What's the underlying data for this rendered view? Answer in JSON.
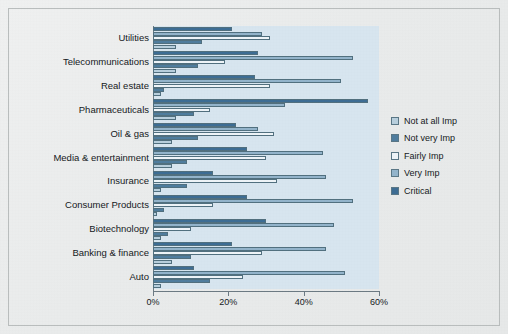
{
  "chart_data": {
    "type": "bar",
    "orientation": "horizontal",
    "title": "",
    "xlabel": "",
    "ylabel": "",
    "xlim": [
      0,
      60
    ],
    "xticks": [
      "0%",
      "20%",
      "40%",
      "60%"
    ],
    "xtick_values": [
      0,
      20,
      40,
      60
    ],
    "grid": false,
    "legend_position": "right",
    "categories": [
      "Utilities",
      "Telecommunications",
      "Real estate",
      "Pharmaceuticals",
      "Oil & gas",
      "Media & entertainment",
      "Insurance",
      "Consumer Products",
      "Biotechnology",
      "Banking & finance",
      "Auto"
    ],
    "series": [
      {
        "name": "Not at all Imp",
        "color": "#b8cfdd",
        "values": [
          6,
          6,
          2,
          6,
          5,
          5,
          2,
          1,
          2,
          5,
          2
        ]
      },
      {
        "name": "Not very Imp",
        "color": "#4f7d9e",
        "values": [
          13,
          12,
          3,
          11,
          12,
          9,
          9,
          3,
          4,
          10,
          15
        ]
      },
      {
        "name": "Fairly Imp",
        "color": "#eef4f8",
        "values": [
          31,
          19,
          31,
          15,
          32,
          30,
          33,
          16,
          10,
          29,
          24
        ]
      },
      {
        "name": "Very Imp",
        "color": "#93b4cb",
        "values": [
          29,
          53,
          50,
          35,
          28,
          45,
          46,
          53,
          48,
          46,
          51
        ]
      },
      {
        "name": "Critical",
        "color": "#3d6d94",
        "values": [
          21,
          28,
          27,
          57,
          22,
          25,
          16,
          25,
          30,
          21,
          11
        ]
      }
    ]
  },
  "legend": {
    "items": [
      {
        "label": "Not at all Imp",
        "color": "#b8cfdd"
      },
      {
        "label": "Not very Imp",
        "color": "#4f7d9e"
      },
      {
        "label": "Fairly Imp",
        "color": "#eef4f8"
      },
      {
        "label": "Very Imp",
        "color": "#93b4cb"
      },
      {
        "label": "Critical",
        "color": "#3d6d94"
      }
    ]
  },
  "colors": {
    "plot_background": "#d7e5ef",
    "page_background": "#eceeee",
    "axis": "#6d7b84",
    "text": "#15191c"
  }
}
